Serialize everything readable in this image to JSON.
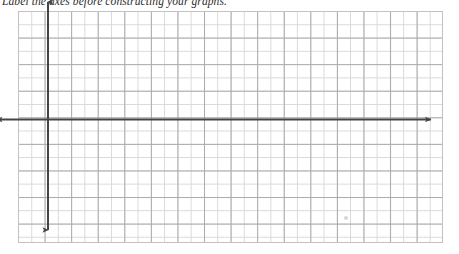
{
  "page": {
    "width": 459,
    "height": 254,
    "background_color": "#ffffff"
  },
  "instruction": {
    "text": "Label the axes before constructing your graphs."
  },
  "graph": {
    "title": "",
    "grid": {
      "x": 18,
      "y": 11,
      "width": 425,
      "height": 232,
      "minor_cell_px": 13.29,
      "major_cell_px": 26.58,
      "minor_color": "#d9d9d9",
      "major_color": "#ababab",
      "border_color": "#c2c2c2",
      "columns": 32,
      "rows": 17
    },
    "axes": {
      "color": "#444444",
      "stroke_width": 2,
      "origin_x": 66,
      "origin_y": 130,
      "x_axis": {
        "label": "",
        "start_x": 12,
        "end_x": 452,
        "y": 130,
        "arrow_start": true,
        "arrow_end": true
      },
      "y_axis": {
        "label": "",
        "x": 66,
        "start_y": 244,
        "end_y": 9,
        "arrow_start": true,
        "arrow_end": true
      },
      "tick_labels_x": [],
      "tick_labels_y": []
    },
    "marks": [
      {
        "name": "stray-pencil-mark",
        "x": 344,
        "y": 216
      }
    ]
  },
  "chart_data": {
    "type": "scatter",
    "title": "",
    "subtitle": "",
    "xlabel": "",
    "ylabel": "",
    "x": [],
    "values": [],
    "series": [],
    "annotations": [],
    "grid": true,
    "legend": false,
    "xlim": [
      -3.6,
      28.4
    ],
    "ylim": [
      -8.5,
      9.0
    ],
    "note": "Blank unlabeled Cartesian grid worksheet; axes drawn with arrowheads, no plotted data, no tick labels."
  }
}
